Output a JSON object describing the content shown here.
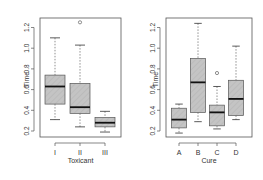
{
  "chart_data": [
    {
      "type": "box",
      "title": "",
      "xlabel": "Toxicant",
      "ylabel": "Time",
      "ylim": [
        0.15,
        1.3
      ],
      "yticks": [
        "0.2",
        "0.4",
        "0.6",
        "0.8",
        "1.0",
        "1.2"
      ],
      "categories": [
        "I",
        "II",
        "III"
      ],
      "boxes": [
        {
          "category": "I",
          "whisker_low": 0.31,
          "q1": 0.46,
          "median": 0.63,
          "q3": 0.74,
          "whisker_high": 1.1,
          "outliers": []
        },
        {
          "category": "II",
          "whisker_low": 0.24,
          "q1": 0.37,
          "median": 0.43,
          "q3": 0.66,
          "whisker_high": 1.03,
          "outliers": [
            1.25
          ]
        },
        {
          "category": "III",
          "whisker_low": 0.19,
          "q1": 0.24,
          "median": 0.28,
          "q3": 0.33,
          "whisker_high": 0.39,
          "outliers": []
        }
      ],
      "grid": false
    },
    {
      "type": "box",
      "title": "",
      "xlabel": "Cure",
      "ylabel": "Time",
      "ylim": [
        0.15,
        1.3
      ],
      "yticks": [
        "0.2",
        "0.4",
        "0.6",
        "0.8",
        "1.0",
        "1.2"
      ],
      "categories": [
        "A",
        "B",
        "C",
        "D"
      ],
      "boxes": [
        {
          "category": "A",
          "whisker_low": 0.18,
          "q1": 0.23,
          "median": 0.31,
          "q3": 0.42,
          "whisker_high": 0.46,
          "outliers": []
        },
        {
          "category": "B",
          "whisker_low": 0.29,
          "q1": 0.38,
          "median": 0.67,
          "q3": 0.9,
          "whisker_high": 1.24,
          "outliers": []
        },
        {
          "category": "C",
          "whisker_low": 0.22,
          "q1": 0.25,
          "median": 0.38,
          "q3": 0.45,
          "whisker_high": 0.63,
          "outliers": [
            0.76
          ]
        },
        {
          "category": "D",
          "whisker_low": 0.31,
          "q1": 0.35,
          "median": 0.51,
          "q3": 0.69,
          "whisker_high": 1.02,
          "outliers": []
        }
      ],
      "grid": false
    }
  ],
  "colors": {
    "box_fill": "#c4c4c4",
    "hatch": "#b0b0b0",
    "median": "#111111",
    "axis": "#555555",
    "text": "#333333"
  },
  "layout": {
    "panels": [
      {
        "plot": {
          "x0": 40,
          "x1": 121,
          "y0": 18,
          "y1": 137
        },
        "centers": [
          55,
          80,
          105
        ],
        "box_width": 20,
        "ylab_x": 13,
        "tick_label_x": 29,
        "xlab_y": 163
      },
      {
        "plot": {
          "x0": 166,
          "x1": 252,
          "y0": 18,
          "y1": 137
        },
        "centers": [
          179,
          198,
          217,
          236
        ],
        "box_width": 15,
        "ylab_x": 142,
        "tick_label_x": 155,
        "xlab_y": 163
      }
    ],
    "y_at_02": 131,
    "px_per_unit": 103.5
  }
}
